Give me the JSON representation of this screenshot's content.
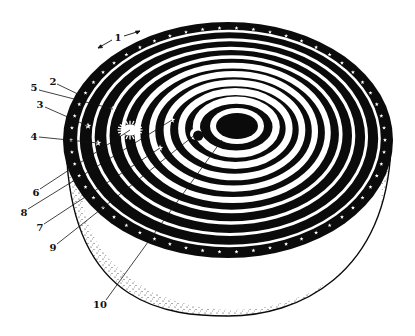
{
  "figure": {
    "colors": {
      "ink": "#0b0b0b",
      "paper": "#ffffff",
      "stipple": "#222222"
    }
  },
  "geometry": {
    "outer": {
      "cx": 228,
      "cy": 140,
      "rx": 165,
      "ry": 118
    },
    "inner": {
      "cx": 237,
      "cy": 126,
      "rx": 21,
      "ry": 13
    },
    "bowl_bottom_y": 316,
    "ring_count": 9
  },
  "bodies": {
    "sun": {
      "name": "sun-icon",
      "x": 130,
      "y": 130,
      "r": 8
    },
    "moon": {
      "name": "moon-crescent-icon",
      "x": 196,
      "y": 134,
      "r": 6
    },
    "planets": [
      {
        "x": 113,
        "y": 109
      },
      {
        "x": 88,
        "y": 126
      },
      {
        "x": 98,
        "y": 143
      },
      {
        "x": 172,
        "y": 120
      },
      {
        "x": 160,
        "y": 148
      }
    ]
  },
  "labels": [
    {
      "text": "1",
      "x": 118,
      "y": 38,
      "tx": 118,
      "ty": 38,
      "lx": 118,
      "ly": 38
    },
    {
      "text": "2",
      "x": 53,
      "y": 82,
      "lx": 57,
      "ly": 84,
      "tx": 82,
      "ty": 96
    },
    {
      "text": "5",
      "x": 34,
      "y": 88,
      "lx": 39,
      "ly": 90,
      "tx": 113,
      "ty": 109
    },
    {
      "text": "3",
      "x": 40,
      "y": 105,
      "lx": 45,
      "ly": 107,
      "tx": 88,
      "ty": 126
    },
    {
      "text": "4",
      "x": 34,
      "y": 137,
      "lx": 39,
      "ly": 137,
      "tx": 98,
      "ty": 143
    },
    {
      "text": "6",
      "x": 36,
      "y": 193,
      "lx": 40,
      "ly": 189,
      "tx": 130,
      "ty": 130
    },
    {
      "text": "8",
      "x": 24,
      "y": 213,
      "lx": 28,
      "ly": 209,
      "tx": 172,
      "ty": 120
    },
    {
      "text": "7",
      "x": 40,
      "y": 228,
      "lx": 44,
      "ly": 224,
      "tx": 160,
      "ty": 148
    },
    {
      "text": "9",
      "x": 53,
      "y": 248,
      "lx": 57,
      "ly": 244,
      "tx": 196,
      "ty": 134
    },
    {
      "text": "10",
      "x": 100,
      "y": 305,
      "lx": 106,
      "ly": 300,
      "tx": 222,
      "ty": 140
    }
  ],
  "arrow_1": {
    "label": "1",
    "left_from": [
      112,
      40
    ],
    "left_to": [
      98,
      48
    ],
    "right_from": [
      124,
      36
    ],
    "right_to": [
      140,
      31
    ]
  }
}
